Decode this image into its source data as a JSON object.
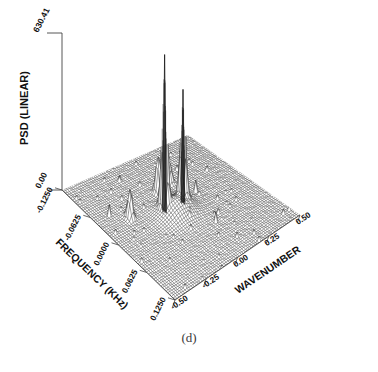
{
  "figure": {
    "caption": "(d)",
    "axes": {
      "z": {
        "label": "PSD (LINEAR)",
        "max_tick": "630.41",
        "min_tick": "0.00"
      },
      "frequency": {
        "label": "FREQUENCY (KHz)",
        "ticks": [
          "-0.1250",
          "-0.0625",
          "0.0000",
          "0.0625",
          "0.1250"
        ]
      },
      "wavenumber": {
        "label": "WAVENUMBER",
        "ticks": [
          "-0.50",
          "-0.25",
          "0.00",
          "0.25",
          "0.50"
        ]
      }
    }
  },
  "chart_data": {
    "type": "line",
    "plot_style": "3d-wireframe-mesh-surface",
    "title": "",
    "subtitle": "",
    "xlabel": "WAVENUMBER",
    "ylabel": "FREQUENCY (KHz)",
    "zlabel": "PSD (LINEAR)",
    "xlim": [
      -0.5,
      0.5
    ],
    "ylim": [
      -0.125,
      0.125
    ],
    "zlim": [
      0.0,
      630.41
    ],
    "xticks": [
      -0.5,
      -0.25,
      0.0,
      0.25,
      0.5
    ],
    "yticks": [
      -0.125,
      -0.0625,
      0.0,
      0.0625,
      0.125
    ],
    "zticks": [
      0.0,
      630.41
    ],
    "grid": false,
    "legend": null,
    "mesh": {
      "nx": 64,
      "ny": 64,
      "color": "#1a1a1a",
      "fill": "#ffffff"
    },
    "peaks": [
      {
        "name": "primary-peak",
        "wavenumber": -0.09,
        "frequency": 0.012,
        "psd": 630.41
      },
      {
        "name": "secondary-peak",
        "wavenumber": 0.05,
        "frequency": 0.01,
        "psd": 455.0
      },
      {
        "name": "sidelobe-left",
        "wavenumber": -0.3,
        "frequency": 0.03,
        "psd": 120.0
      },
      {
        "name": "sidelobe-mid",
        "wavenumber": -0.02,
        "frequency": 0.045,
        "psd": 165.0
      },
      {
        "name": "sidelobe-right",
        "wavenumber": 0.1,
        "frequency": 0.055,
        "psd": 95.0
      },
      {
        "name": "noise-floor",
        "wavenumber": 0.0,
        "frequency": 0.0,
        "psd": 10.0
      }
    ]
  }
}
